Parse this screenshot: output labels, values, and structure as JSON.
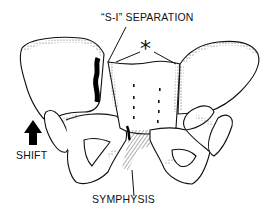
{
  "figure": {
    "labels": {
      "si_separation": "“S-I” SEPARATION",
      "shift": "SHIFT",
      "symphysis": "SYMPHYSIS",
      "asterisk": "*"
    },
    "icons": {
      "shift_arrow": "arrow-up-icon"
    },
    "colors": {
      "line": "#111111",
      "background": "#ffffff",
      "stipple": "#555555"
    }
  }
}
